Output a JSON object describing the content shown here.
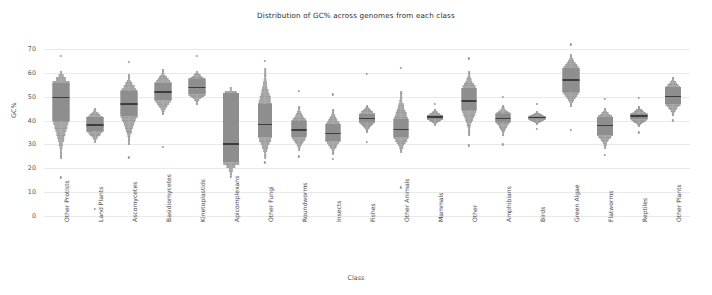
{
  "chart_data": {
    "type": "box",
    "title": "Distribution of GC% across genomes from each class",
    "xlabel": "Class",
    "ylabel": "GC%",
    "ylim": [
      0,
      73
    ],
    "yticks": [
      0,
      10,
      20,
      30,
      40,
      50,
      60,
      70
    ],
    "grid": true,
    "legend": "none",
    "orientation": "vertical",
    "style": "violin-box hybrid, gray fill",
    "colors": {
      "fill": "#8e8e8e",
      "violin": "#9a9a9a",
      "median": "#3d3d3d",
      "grid": "#e9e9e9",
      "text": "#4a4a4a"
    },
    "categories": [
      "Other Protists",
      "Land Plants",
      "Ascomycetes",
      "Basidiomycetes",
      "Kinetoplastids",
      "Apicomplexans",
      "Other Fungi",
      "Roundworms",
      "Insects",
      "Fishes",
      "Other Animals",
      "Mammals",
      "Other",
      "Amphibians",
      "Birds",
      "Green Algae",
      "Flatworms",
      "Reptiles",
      "Other Plants"
    ],
    "boxes": [
      {
        "category": "Other Protists",
        "q1": 40.0,
        "median": 49.8,
        "q3": 56.0,
        "whisker_low": 25.5,
        "whisker_high": 60.5,
        "violin_low": 24.0,
        "violin_high": 61.0,
        "violin_width": 17,
        "outliers": [
          67.0,
          16.2
        ]
      },
      {
        "category": "Land Plants",
        "q1": 35.5,
        "median": 38.2,
        "q3": 41.5,
        "whisker_low": 32.0,
        "whisker_high": 44.5,
        "violin_low": 31.0,
        "violin_high": 45.5,
        "violin_width": 17,
        "outliers": [
          3.0
        ]
      },
      {
        "category": "Ascomycetes",
        "q1": 42.0,
        "median": 47.0,
        "q3": 52.5,
        "whisker_low": 36.0,
        "whisker_high": 57.5,
        "violin_low": 30.0,
        "violin_high": 59.5,
        "violin_width": 17,
        "outliers": [
          24.5,
          64.5
        ]
      },
      {
        "category": "Basidiomycetes",
        "q1": 48.5,
        "median": 52.0,
        "q3": 56.0,
        "whisker_low": 44.0,
        "whisker_high": 60.0,
        "violin_low": 42.5,
        "violin_high": 61.5,
        "violin_width": 17,
        "outliers": [
          29.0
        ]
      },
      {
        "category": "Kinetoplastids",
        "q1": 51.0,
        "median": 53.8,
        "q3": 57.5,
        "whisker_low": 48.0,
        "whisker_high": 60.0,
        "violin_low": 47.0,
        "violin_high": 61.0,
        "violin_width": 17,
        "outliers": [
          67.0
        ]
      },
      {
        "category": "Apicomplexans",
        "q1": 22.5,
        "median": 30.2,
        "q3": 51.5,
        "whisker_low": 18.5,
        "whisker_high": 53.5,
        "violin_low": 17.5,
        "violin_high": 54.0,
        "violin_width": 16,
        "outliers": [
          16.5
        ]
      },
      {
        "category": "Other Fungi",
        "q1": 33.0,
        "median": 38.5,
        "q3": 47.0,
        "whisker_low": 25.5,
        "whisker_high": 58.5,
        "violin_low": 24.0,
        "violin_high": 62.0,
        "violin_width": 14,
        "outliers": [
          65.0,
          22.5
        ]
      },
      {
        "category": "Roundworms",
        "q1": 33.0,
        "median": 36.0,
        "q3": 40.0,
        "whisker_low": 29.0,
        "whisker_high": 44.5,
        "violin_low": 27.5,
        "violin_high": 46.0,
        "violin_width": 15,
        "outliers": [
          25.0,
          52.5
        ]
      },
      {
        "category": "Insects",
        "q1": 31.5,
        "median": 34.5,
        "q3": 38.5,
        "whisker_low": 27.5,
        "whisker_high": 43.0,
        "violin_low": 26.0,
        "violin_high": 45.0,
        "violin_width": 15,
        "outliers": [
          24.0,
          51.0
        ]
      },
      {
        "category": "Fishes",
        "q1": 39.5,
        "median": 41.0,
        "q3": 43.0,
        "whisker_low": 36.5,
        "whisker_high": 45.5,
        "violin_low": 35.0,
        "violin_high": 46.5,
        "violin_width": 16,
        "outliers": [
          31.0,
          59.5
        ]
      },
      {
        "category": "Other Animals",
        "q1": 33.0,
        "median": 36.2,
        "q3": 40.5,
        "whisker_low": 28.5,
        "whisker_high": 48.5,
        "violin_low": 26.5,
        "violin_high": 52.5,
        "violin_width": 15,
        "outliers": [
          12.0,
          62.0
        ]
      },
      {
        "category": "Mammals",
        "q1": 40.8,
        "median": 41.5,
        "q3": 42.3,
        "whisker_low": 39.0,
        "whisker_high": 44.0,
        "violin_low": 38.0,
        "violin_high": 45.0,
        "violin_width": 16,
        "outliers": [
          47.0
        ]
      },
      {
        "category": "Other",
        "q1": 44.5,
        "median": 48.2,
        "q3": 53.5,
        "whisker_low": 38.0,
        "whisker_high": 58.0,
        "violin_low": 34.0,
        "violin_high": 61.0,
        "violin_width": 15,
        "outliers": [
          29.5,
          66.0
        ]
      },
      {
        "category": "Amphibians",
        "q1": 39.5,
        "median": 41.0,
        "q3": 43.0,
        "whisker_low": 36.0,
        "whisker_high": 45.0,
        "violin_low": 34.0,
        "violin_high": 46.5,
        "violin_width": 15,
        "outliers": [
          30.0,
          50.0
        ]
      },
      {
        "category": "Birds",
        "q1": 40.5,
        "median": 41.2,
        "q3": 42.0,
        "whisker_low": 39.5,
        "whisker_high": 43.0,
        "violin_low": 38.5,
        "violin_high": 44.0,
        "violin_width": 17,
        "outliers": [
          47.0,
          36.5
        ]
      },
      {
        "category": "Green Algae",
        "q1": 52.0,
        "median": 57.0,
        "q3": 62.0,
        "whisker_low": 47.5,
        "whisker_high": 66.5,
        "violin_low": 46.0,
        "violin_high": 68.0,
        "violin_width": 17,
        "outliers": [
          72.0,
          36.0
        ]
      },
      {
        "category": "Flatworms",
        "q1": 34.0,
        "median": 38.0,
        "q3": 41.5,
        "whisker_low": 30.0,
        "whisker_high": 44.0,
        "violin_low": 28.5,
        "violin_high": 45.5,
        "violin_width": 16,
        "outliers": [
          25.5,
          49.0
        ]
      },
      {
        "category": "Reptiles",
        "q1": 40.5,
        "median": 42.0,
        "q3": 43.0,
        "whisker_low": 38.5,
        "whisker_high": 44.5,
        "violin_low": 37.5,
        "violin_high": 46.0,
        "violin_width": 17,
        "outliers": [
          35.0,
          49.5
        ]
      },
      {
        "category": "Other Plants",
        "q1": 47.0,
        "median": 50.2,
        "q3": 54.0,
        "whisker_low": 43.5,
        "whisker_high": 57.0,
        "violin_low": 42.0,
        "violin_high": 58.5,
        "violin_width": 16,
        "outliers": [
          40.0
        ]
      }
    ]
  }
}
